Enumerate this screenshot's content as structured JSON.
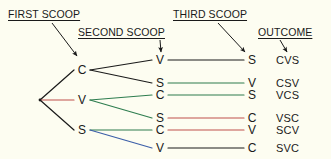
{
  "diagram": {
    "background_color": "#fdfdf1",
    "line_color": "#1a1a1a",
    "accent_color": "#c0504d",
    "headers": [
      {
        "id": "first-scoop",
        "label": "FIRST SCOOP",
        "x": 8,
        "y": 8,
        "arrow": {
          "x1": 52,
          "y1": 23,
          "x2": 77,
          "y2": 56
        }
      },
      {
        "id": "second-scoop",
        "label": "SECOND SCOOP",
        "x": 78,
        "y": 26,
        "arrow": {
          "x1": 160,
          "y1": 40,
          "x2": 161,
          "y2": 52
        }
      },
      {
        "id": "third-scoop",
        "label": "THIRD SCOOP",
        "x": 173,
        "y": 8,
        "arrow": {
          "x1": 218,
          "y1": 23,
          "x2": 245,
          "y2": 52
        }
      },
      {
        "id": "outcome",
        "label": "OUTCOME",
        "x": 258,
        "y": 26,
        "arrow": {
          "x1": 280,
          "y1": 40,
          "x2": 287,
          "y2": 52
        }
      }
    ],
    "root": {
      "x": 40,
      "y": 100
    },
    "first_scoop_nodes": [
      {
        "id": "c1",
        "label": "C",
        "x": 82,
        "y": 70,
        "edge_color": "#1a1a1a"
      },
      {
        "id": "v1",
        "label": "V",
        "x": 82,
        "y": 100,
        "edge_color": "#c0504d"
      },
      {
        "id": "s1",
        "label": "S",
        "x": 82,
        "y": 130,
        "edge_color": "#1a1a1a"
      }
    ],
    "second_scoop_nodes": [
      {
        "id": "c-v",
        "label": "V",
        "parent": "c1",
        "x": 160,
        "y": 60,
        "edge_color": "#1a1a1a"
      },
      {
        "id": "c-s",
        "label": "S",
        "parent": "c1",
        "x": 160,
        "y": 83,
        "edge_color": "#1a1a1a"
      },
      {
        "id": "v-c",
        "label": "C",
        "parent": "v1",
        "x": 160,
        "y": 95,
        "edge_color": "#2e7d4f"
      },
      {
        "id": "v-s",
        "label": "S",
        "parent": "v1",
        "x": 160,
        "y": 118,
        "edge_color": "#2e7d4f"
      },
      {
        "id": "s-c",
        "label": "C",
        "parent": "s1",
        "x": 160,
        "y": 130,
        "edge_color": "#2e7d4f"
      },
      {
        "id": "s-v",
        "label": "V",
        "parent": "s1",
        "x": 160,
        "y": 148,
        "edge_color": "#3b5ea8"
      }
    ],
    "third_scoop_nodes": [
      {
        "id": "t1",
        "label": "S",
        "parent": "c-v",
        "x": 252,
        "y": 60,
        "edge_color": "#1a1a1a"
      },
      {
        "id": "t2",
        "label": "V",
        "parent": "c-s",
        "x": 252,
        "y": 83,
        "edge_color": "#2e7d4f"
      },
      {
        "id": "t3",
        "label": "S",
        "parent": "v-c",
        "x": 252,
        "y": 95,
        "edge_color": "#2e7d4f"
      },
      {
        "id": "t4",
        "label": "C",
        "parent": "v-s",
        "x": 252,
        "y": 118,
        "edge_color": "#c0504d"
      },
      {
        "id": "t5",
        "label": "V",
        "parent": "s-c",
        "x": 252,
        "y": 130,
        "edge_color": "#c0504d"
      },
      {
        "id": "t6",
        "label": "C",
        "parent": "s-v",
        "x": 252,
        "y": 148,
        "edge_color": "#1a1a1a"
      }
    ],
    "outcomes": [
      {
        "id": "o1",
        "label": "CVS",
        "x": 276,
        "y": 60
      },
      {
        "id": "o2",
        "label": "CSV",
        "x": 276,
        "y": 83
      },
      {
        "id": "o3",
        "label": "VCS",
        "x": 276,
        "y": 95
      },
      {
        "id": "o4",
        "label": "VSC",
        "x": 276,
        "y": 118
      },
      {
        "id": "o5",
        "label": "SCV",
        "x": 276,
        "y": 130
      },
      {
        "id": "o6",
        "label": "SVC",
        "x": 276,
        "y": 148
      }
    ]
  },
  "chart_data": {
    "type": "table",
    "stage_labels": [
      "FIRST SCOOP",
      "SECOND SCOOP",
      "THIRD SCOOP",
      "OUTCOME"
    ],
    "flavors": [
      "C",
      "V",
      "S"
    ],
    "paths": [
      {
        "first": "C",
        "second": "V",
        "third": "S",
        "outcome": "CVS"
      },
      {
        "first": "C",
        "second": "S",
        "third": "V",
        "outcome": "CSV"
      },
      {
        "first": "V",
        "second": "C",
        "third": "S",
        "outcome": "VCS"
      },
      {
        "first": "V",
        "second": "S",
        "third": "C",
        "outcome": "VSC"
      },
      {
        "first": "S",
        "second": "C",
        "third": "V",
        "outcome": "SCV"
      },
      {
        "first": "S",
        "second": "V",
        "third": "C",
        "outcome": "SVC"
      }
    ],
    "total_outcomes": 6
  }
}
